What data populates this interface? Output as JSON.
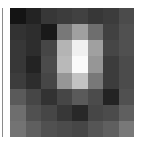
{
  "chart_data": {
    "type": "heatmap",
    "title": "",
    "xlabel": "",
    "ylabel": "",
    "rows": 8,
    "cols": 8,
    "colormap": "gray",
    "value_range": [
      0,
      255
    ],
    "grid": false,
    "legend": "none",
    "values": [
      [
        20,
        35,
        55,
        60,
        65,
        55,
        60,
        75
      ],
      [
        50,
        45,
        25,
        120,
        160,
        110,
        65,
        80
      ],
      [
        55,
        45,
        70,
        180,
        240,
        160,
        70,
        80
      ],
      [
        55,
        35,
        75,
        185,
        250,
        150,
        60,
        75
      ],
      [
        60,
        45,
        70,
        150,
        195,
        120,
        60,
        75
      ],
      [
        90,
        70,
        50,
        70,
        90,
        75,
        35,
        80
      ],
      [
        110,
        80,
        70,
        55,
        40,
        70,
        75,
        95
      ],
      [
        115,
        95,
        80,
        75,
        70,
        85,
        95,
        120
      ]
    ]
  },
  "colors": {
    "background": "#ffffff",
    "border": "#8a8a8a"
  }
}
